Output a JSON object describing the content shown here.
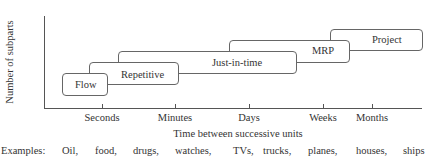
{
  "diagram": {
    "y_axis_label": "Number of subparts",
    "x_axis_label": "Time between successive units",
    "x_ticks": [
      "Seconds",
      "Minutes",
      "Days",
      "Weeks",
      "Months"
    ],
    "boxes": [
      {
        "label": "Flow"
      },
      {
        "label": "Repetitive"
      },
      {
        "label": "Just-in-time"
      },
      {
        "label": "MRP"
      },
      {
        "label": "Project"
      }
    ],
    "examples_label": "Examples:",
    "examples": [
      "Oil,",
      "food,",
      "drugs,",
      "watches,",
      "TVs,",
      "trucks,",
      "planes,",
      "houses,",
      "ships"
    ]
  }
}
